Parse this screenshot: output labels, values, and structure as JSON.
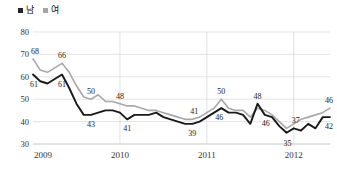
{
  "legend": {
    "position": "top-left",
    "items": [
      {
        "label": "남",
        "color": "#262626",
        "name": "male"
      },
      {
        "label": "여",
        "color": "#a6a6a6",
        "name": "female"
      }
    ]
  },
  "axes": {
    "y_ticks": [
      "30",
      "40",
      "50",
      "60",
      "70",
      "80"
    ],
    "x_ticks": [
      "2009",
      "2010",
      "2011",
      "2012"
    ]
  },
  "colors": {
    "male_line": "#1a1a1a",
    "female_line": "#a8a8a8",
    "gridline": "#d9d9d9",
    "axis": "#bfbfbf",
    "text": "#333333",
    "background": "#ffffff"
  },
  "chart_data": {
    "type": "line",
    "title": "",
    "subtitle": "",
    "xlabel": "",
    "ylabel": "",
    "ylim": [
      30,
      80
    ],
    "ytick_step": 10,
    "grid": true,
    "legend_position": "top-left",
    "x": [
      "2009-01",
      "2009-02",
      "2009-03",
      "2009-04",
      "2009-05",
      "2009-06",
      "2009-07",
      "2009-08",
      "2009-09",
      "2009-10",
      "2009-11",
      "2009-12",
      "2010-01",
      "2010-02",
      "2010-03",
      "2010-04",
      "2010-05",
      "2010-06",
      "2010-07",
      "2010-08",
      "2010-09",
      "2010-10",
      "2010-11",
      "2010-12",
      "2011-01",
      "2011-02",
      "2011-03",
      "2011-04",
      "2011-05",
      "2011-06",
      "2011-07",
      "2011-08",
      "2011-09",
      "2011-10",
      "2011-11",
      "2011-12",
      "2012-01",
      "2012-02",
      "2012-03",
      "2012-04",
      "2012-05",
      "2012-06"
    ],
    "xtick_labels": [
      "2009",
      "2010",
      "2011",
      "2012"
    ],
    "xtick_index": [
      0,
      12,
      24,
      36
    ],
    "series": [
      {
        "name": "남",
        "color": "#1a1a1a",
        "values": [
          61,
          58,
          57,
          59,
          61,
          55,
          48,
          43,
          43,
          44,
          45,
          45,
          44,
          41,
          43,
          43,
          43,
          44,
          42,
          41,
          40,
          39,
          39,
          40,
          42,
          44,
          46,
          44,
          44,
          43,
          39,
          48,
          43,
          42,
          38,
          35,
          37,
          36,
          39,
          37,
          42,
          42
        ]
      },
      {
        "name": "여",
        "color": "#a8a8a8",
        "values": [
          68,
          63,
          62,
          64,
          66,
          62,
          56,
          51,
          50,
          52,
          49,
          49,
          48,
          47,
          47,
          46,
          45,
          45,
          44,
          43,
          42,
          41,
          41,
          42,
          44,
          46,
          50,
          46,
          45,
          45,
          42,
          46,
          45,
          43,
          40,
          37,
          39,
          41,
          42,
          43,
          44,
          46
        ]
      }
    ],
    "annotations": [
      {
        "text": "68",
        "series": "여",
        "index": 0,
        "dx": 2,
        "dy": -8
      },
      {
        "text": "66",
        "series": "여",
        "index": 4,
        "dx": 0,
        "dy": -8
      },
      {
        "text": "61",
        "series": "남",
        "index": 0,
        "dx": 1,
        "dy": 9
      },
      {
        "text": "61",
        "series": "남",
        "index": 4,
        "dx": 0,
        "dy": 9
      },
      {
        "text": "50",
        "series": "여",
        "index": 8,
        "dx": 0,
        "dy": -8
      },
      {
        "text": "43",
        "series": "남",
        "index": 8,
        "dx": 0,
        "dy": 9
      },
      {
        "text": "48",
        "series": "여",
        "index": 12,
        "dx": 0,
        "dy": -8
      },
      {
        "text": "41",
        "series": "남",
        "index": 13,
        "dx": 0,
        "dy": 9
      },
      {
        "text": "41",
        "series": "여",
        "index": 22,
        "dx": 2,
        "dy": -8
      },
      {
        "text": "39",
        "series": "남",
        "index": 22,
        "dx": 0,
        "dy": 9
      },
      {
        "text": "50",
        "series": "여",
        "index": 26,
        "dx": 0,
        "dy": -8
      },
      {
        "text": "46",
        "series": "남",
        "index": 26,
        "dx": -2,
        "dy": 9
      },
      {
        "text": "48",
        "series": "남",
        "index": 31,
        "dx": 0,
        "dy": -8
      },
      {
        "text": "46",
        "series": "남",
        "index": 32,
        "dx": 1,
        "dy": 8
      },
      {
        "text": "37",
        "series": "남",
        "index": 36,
        "dx": 2,
        "dy": -8
      },
      {
        "text": "35",
        "series": "남",
        "index": 35,
        "dx": 1,
        "dy": 10
      },
      {
        "text": "46",
        "series": "여",
        "index": 41,
        "dx": -1,
        "dy": -8
      },
      {
        "text": "42",
        "series": "남",
        "index": 41,
        "dx": -1,
        "dy": 9
      }
    ]
  }
}
